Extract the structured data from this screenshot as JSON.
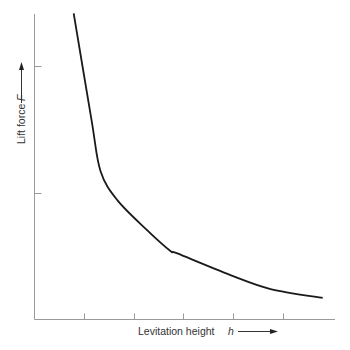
{
  "chart_data": {
    "type": "line",
    "title": "",
    "xlabel": "Levitation height",
    "xlabel_symbol": "h",
    "ylabel": "Lift force",
    "ylabel_symbol": "F",
    "x_ticks": [
      1,
      2,
      3,
      4,
      5
    ],
    "y_ticks": [
      1,
      2
    ],
    "tick_labels_shown": false,
    "xlim": [
      0,
      6.05
    ],
    "ylim": [
      0,
      2.45
    ],
    "grid": false,
    "legend": "none",
    "series": [
      {
        "name": "Lift force vs levitation height",
        "x": [
          0.79,
          1.15,
          1.33,
          1.67,
          2.28,
          2.74,
          2.88,
          3.95,
          4.76,
          5.81
        ],
        "y": [
          2.41,
          1.57,
          1.17,
          0.94,
          0.7,
          0.54,
          0.52,
          0.35,
          0.24,
          0.17
        ]
      }
    ]
  }
}
